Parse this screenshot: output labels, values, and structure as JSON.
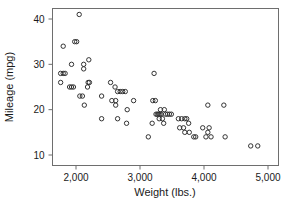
{
  "chart_data": {
    "type": "scatter",
    "title": "",
    "xlabel": "Weight (lbs.)",
    "ylabel": "Mileage (mpg)",
    "xlim": [
      1700,
      5050
    ],
    "ylim": [
      9,
      42
    ],
    "grid": false,
    "legend": null,
    "xticks": [
      2000,
      3000,
      4000,
      5000
    ],
    "xtick_labels": [
      "2,000",
      "3,000",
      "4,000",
      "5,000"
    ],
    "yticks": [
      10,
      20,
      30,
      40
    ],
    "ytick_labels": [
      "10",
      "20",
      "30",
      "40"
    ],
    "marker": "open-circle",
    "marker_color": "#333333",
    "points": [
      {
        "x": 2050,
        "y": 41
      },
      {
        "x": 1980,
        "y": 35
      },
      {
        "x": 2010,
        "y": 35
      },
      {
        "x": 1800,
        "y": 34
      },
      {
        "x": 2200,
        "y": 31
      },
      {
        "x": 1930,
        "y": 30
      },
      {
        "x": 2120,
        "y": 30
      },
      {
        "x": 2120,
        "y": 29
      },
      {
        "x": 1760,
        "y": 28
      },
      {
        "x": 1800,
        "y": 28
      },
      {
        "x": 1830,
        "y": 28
      },
      {
        "x": 3220,
        "y": 28
      },
      {
        "x": 2540,
        "y": 26
      },
      {
        "x": 2190,
        "y": 26
      },
      {
        "x": 2210,
        "y": 26
      },
      {
        "x": 1760,
        "y": 26
      },
      {
        "x": 1900,
        "y": 25
      },
      {
        "x": 1930,
        "y": 25
      },
      {
        "x": 1960,
        "y": 25
      },
      {
        "x": 2180,
        "y": 25
      },
      {
        "x": 2610,
        "y": 25
      },
      {
        "x": 2650,
        "y": 24
      },
      {
        "x": 2690,
        "y": 24
      },
      {
        "x": 2730,
        "y": 24
      },
      {
        "x": 2770,
        "y": 24
      },
      {
        "x": 2060,
        "y": 23
      },
      {
        "x": 2100,
        "y": 23
      },
      {
        "x": 2400,
        "y": 23
      },
      {
        "x": 2900,
        "y": 22
      },
      {
        "x": 2560,
        "y": 22
      },
      {
        "x": 2620,
        "y": 22
      },
      {
        "x": 3200,
        "y": 22
      },
      {
        "x": 3240,
        "y": 22
      },
      {
        "x": 2130,
        "y": 21
      },
      {
        "x": 2620,
        "y": 21
      },
      {
        "x": 4060,
        "y": 21
      },
      {
        "x": 4310,
        "y": 21
      },
      {
        "x": 2800,
        "y": 20
      },
      {
        "x": 3320,
        "y": 20
      },
      {
        "x": 3380,
        "y": 20
      },
      {
        "x": 3250,
        "y": 19
      },
      {
        "x": 3270,
        "y": 19
      },
      {
        "x": 3290,
        "y": 19
      },
      {
        "x": 3310,
        "y": 19
      },
      {
        "x": 3330,
        "y": 19
      },
      {
        "x": 3400,
        "y": 19
      },
      {
        "x": 3430,
        "y": 19
      },
      {
        "x": 3460,
        "y": 19
      },
      {
        "x": 3490,
        "y": 19
      },
      {
        "x": 3300,
        "y": 18
      },
      {
        "x": 3350,
        "y": 18
      },
      {
        "x": 3600,
        "y": 18
      },
      {
        "x": 3650,
        "y": 18
      },
      {
        "x": 3700,
        "y": 18
      },
      {
        "x": 3730,
        "y": 18
      },
      {
        "x": 2400,
        "y": 18
      },
      {
        "x": 2650,
        "y": 18
      },
      {
        "x": 2790,
        "y": 17
      },
      {
        "x": 3190,
        "y": 17
      },
      {
        "x": 3370,
        "y": 17
      },
      {
        "x": 3760,
        "y": 17
      },
      {
        "x": 3620,
        "y": 16
      },
      {
        "x": 3680,
        "y": 16
      },
      {
        "x": 3980,
        "y": 16
      },
      {
        "x": 4080,
        "y": 16
      },
      {
        "x": 3700,
        "y": 15
      },
      {
        "x": 3770,
        "y": 15
      },
      {
        "x": 4060,
        "y": 15
      },
      {
        "x": 3130,
        "y": 14
      },
      {
        "x": 3840,
        "y": 14
      },
      {
        "x": 3870,
        "y": 14
      },
      {
        "x": 4030,
        "y": 14
      },
      {
        "x": 4110,
        "y": 14
      },
      {
        "x": 4330,
        "y": 14
      },
      {
        "x": 4730,
        "y": 12
      },
      {
        "x": 4840,
        "y": 12
      }
    ]
  }
}
